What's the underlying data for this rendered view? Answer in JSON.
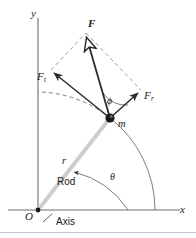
{
  "figure": {
    "background_color": "#ffffff",
    "stroke_color": "#2b2b2b",
    "rod_color": "#d4d2cc",
    "axes": {
      "x_label": "x",
      "y_label": "y",
      "origin_label": "O"
    },
    "labels": {
      "force": "F",
      "force_tangential_base": "F",
      "force_tangential_sub": "t",
      "force_radial_base": "F",
      "force_radial_sub": "r",
      "mass": "m",
      "radius": "r",
      "rod": "Rod",
      "axis_callout": "Axis",
      "angle_phi": "ϕ",
      "angle_theta": "θ"
    },
    "vectors": [
      {
        "name": "F",
        "label": "F",
        "arrowhead": "hollow",
        "from": [
          110,
          118
        ],
        "to": [
          86,
          33
        ],
        "style": "solid"
      },
      {
        "name": "Ft",
        "label": "F_t",
        "arrowhead": "filled",
        "from": [
          110,
          118
        ],
        "to": [
          51,
          70
        ],
        "style": "solid"
      },
      {
        "name": "Fr",
        "label": "F_r",
        "arrowhead": "filled",
        "from": [
          110,
          118
        ],
        "to": [
          141,
          90
        ],
        "style": "solid"
      }
    ],
    "parallelogram": {
      "style": "dashed",
      "vertices": [
        [
          110,
          118
        ],
        [
          51,
          70
        ],
        [
          86,
          33
        ],
        [
          141,
          90
        ]
      ]
    },
    "mass_point": [
      110,
      118
    ],
    "origin_point": [
      38,
      210
    ],
    "arcs": {
      "trajectory": "circular path of radius r through the mass, dashed near the y-axis",
      "theta": "angle from x-axis to rod measured at origin"
    }
  }
}
